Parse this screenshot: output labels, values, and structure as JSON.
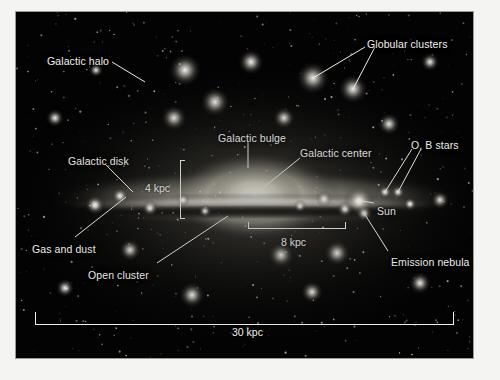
{
  "figure": {
    "kind": "astronomy-diagram",
    "plate_color": "#030303",
    "label_color": "#f0f0ee",
    "mount_color": "#f4f4f2"
  },
  "labels": [
    {
      "id": "galactic-halo",
      "text": "Galactic halo",
      "x": 47,
      "y": 55
    },
    {
      "id": "globular-clusters",
      "text": "Globular clusters",
      "x": 367,
      "y": 38
    },
    {
      "id": "galactic-bulge",
      "text": "Galactic bulge",
      "x": 218,
      "y": 132
    },
    {
      "id": "galactic-center",
      "text": "Galactic center",
      "x": 300,
      "y": 147
    },
    {
      "id": "ob-stars",
      "text": "O, B stars",
      "x": 411,
      "y": 139
    },
    {
      "id": "galactic-disk",
      "text": "Galactic disk",
      "x": 68,
      "y": 155
    },
    {
      "id": "sun",
      "text": "Sun",
      "x": 377,
      "y": 205
    },
    {
      "id": "gas-and-dust",
      "text": "Gas and dust",
      "x": 32,
      "y": 243
    },
    {
      "id": "open-cluster",
      "text": "Open cluster",
      "x": 88,
      "y": 269
    },
    {
      "id": "emission-nebula",
      "text": "Emission nebula",
      "x": 391,
      "y": 256
    }
  ],
  "scale_labels": [
    {
      "id": "height-4kpc",
      "text": "4 kpc",
      "x": 145,
      "y": 182,
      "orientation": "vertical-bracket"
    },
    {
      "id": "sun-distance",
      "text": "8 kpc",
      "x": 281,
      "y": 236,
      "orientation": "horizontal-bracket"
    },
    {
      "id": "galaxy-width",
      "text": "30 kpc",
      "x": 232,
      "y": 326,
      "orientation": "horizontal-bar"
    }
  ],
  "measurements": {
    "disk_thickness": "4 kpc",
    "sun_to_center": "8 kpc",
    "galaxy_diameter": "30 kpc"
  },
  "leaders": [
    {
      "id": "leader-galactic-halo",
      "x1": 112,
      "y1": 62,
      "x2": 145,
      "y2": 82
    },
    {
      "id": "leader-globular-left",
      "x1": 365,
      "y1": 47,
      "x2": 313,
      "y2": 78
    },
    {
      "id": "leader-globular-right",
      "x1": 375,
      "y1": 47,
      "x2": 353,
      "y2": 89
    },
    {
      "id": "leader-galactic-bulge",
      "x1": 248,
      "y1": 142,
      "x2": 248,
      "y2": 168
    },
    {
      "id": "leader-galactic-center",
      "x1": 300,
      "y1": 158,
      "x2": 253,
      "y2": 196
    },
    {
      "id": "leader-ob-star-a",
      "x1": 412,
      "y1": 149,
      "x2": 385,
      "y2": 192
    },
    {
      "id": "leader-ob-star-b",
      "x1": 421,
      "y1": 149,
      "x2": 398,
      "y2": 192
    },
    {
      "id": "leader-galactic-disk",
      "x1": 106,
      "y1": 165,
      "x2": 133,
      "y2": 192
    },
    {
      "id": "leader-sun",
      "x1": 374,
      "y1": 203,
      "x2": 362,
      "y2": 201
    },
    {
      "id": "leader-gas-and-dust",
      "x1": 75,
      "y1": 237,
      "x2": 126,
      "y2": 197
    },
    {
      "id": "leader-open-cluster",
      "x1": 157,
      "y1": 263,
      "x2": 228,
      "y2": 216
    },
    {
      "id": "leader-emission-nebula",
      "x1": 388,
      "y1": 251,
      "x2": 364,
      "y2": 213
    }
  ],
  "globular_clusters": [
    {
      "x": 185,
      "y": 70,
      "r": 9
    },
    {
      "x": 215,
      "y": 102,
      "r": 8
    },
    {
      "x": 251,
      "y": 62,
      "r": 7
    },
    {
      "x": 313,
      "y": 78,
      "r": 9
    },
    {
      "x": 353,
      "y": 89,
      "r": 8
    },
    {
      "x": 174,
      "y": 118,
      "r": 7
    },
    {
      "x": 284,
      "y": 118,
      "r": 6
    },
    {
      "x": 389,
      "y": 124,
      "r": 6
    },
    {
      "x": 55,
      "y": 118,
      "r": 5
    },
    {
      "x": 430,
      "y": 62,
      "r": 5
    },
    {
      "x": 130,
      "y": 250,
      "r": 6
    },
    {
      "x": 192,
      "y": 295,
      "r": 7
    },
    {
      "x": 281,
      "y": 255,
      "r": 7
    },
    {
      "x": 337,
      "y": 253,
      "r": 7
    },
    {
      "x": 312,
      "y": 292,
      "r": 6
    },
    {
      "x": 420,
      "y": 283,
      "r": 6
    },
    {
      "x": 65,
      "y": 288,
      "r": 5
    },
    {
      "x": 440,
      "y": 200,
      "r": 5
    },
    {
      "x": 96,
      "y": 70,
      "r": 4
    }
  ],
  "disk_knots": [
    {
      "x": 95,
      "y": 205,
      "r": 6
    },
    {
      "x": 120,
      "y": 196,
      "r": 5
    },
    {
      "x": 150,
      "y": 208,
      "r": 5
    },
    {
      "x": 183,
      "y": 200,
      "r": 4
    },
    {
      "x": 205,
      "y": 211,
      "r": 4
    },
    {
      "x": 300,
      "y": 206,
      "r": 4
    },
    {
      "x": 324,
      "y": 199,
      "r": 5
    },
    {
      "x": 345,
      "y": 209,
      "r": 5
    },
    {
      "x": 385,
      "y": 192,
      "r": 4
    },
    {
      "x": 398,
      "y": 192,
      "r": 4
    },
    {
      "x": 364,
      "y": 213,
      "r": 5
    },
    {
      "x": 410,
      "y": 204,
      "r": 4
    }
  ],
  "sun_marker": {
    "x": 359,
    "y": 201,
    "r": 6
  }
}
